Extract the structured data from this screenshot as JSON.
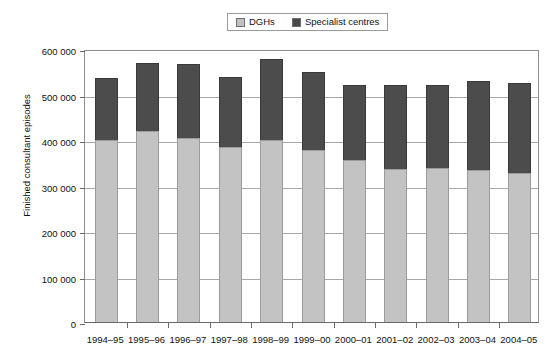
{
  "chart_data": {
    "type": "bar",
    "subtype": "stacked-vertical",
    "title": "",
    "xlabel": "",
    "ylabel": "Finished consultant episodes",
    "ylim": [
      0,
      600000
    ],
    "yticks": [
      0,
      100000,
      200000,
      300000,
      400000,
      500000,
      600000
    ],
    "ytick_labels": [
      "0",
      "100 000",
      "200 000",
      "300 000",
      "400 000",
      "500 000",
      "600 000"
    ],
    "grid": true,
    "legend_position": "top-center",
    "categories": [
      "1994-95",
      "1995-96",
      "1996-97",
      "1997-98",
      "1998-99",
      "1999-00",
      "2000-01",
      "2001-02",
      "2002-03",
      "2003-04",
      "2004-05"
    ],
    "series": [
      {
        "name": "DGHs",
        "color": "#c3c3c3",
        "values": [
          400000,
          420000,
          404000,
          385000,
          400000,
          378000,
          356000,
          336000,
          338000,
          334000,
          328000
        ]
      },
      {
        "name": "Specialist centres",
        "color": "#4c4c4c",
        "values": [
          137000,
          150000,
          162000,
          154000,
          177000,
          172000,
          166000,
          186000,
          184000,
          195000,
          198000
        ]
      }
    ],
    "totals": [
      537000,
      570000,
      566000,
      539000,
      577000,
      550000,
      522000,
      522000,
      522000,
      529000,
      526000
    ]
  },
  "legend": {
    "entries": [
      {
        "label": "DGHs",
        "swatch": "dgh"
      },
      {
        "label": "Specialist centres",
        "swatch": "spec"
      }
    ]
  }
}
